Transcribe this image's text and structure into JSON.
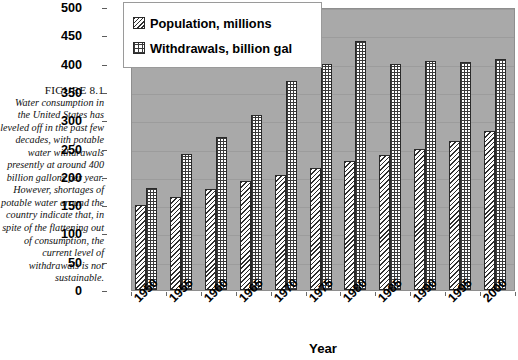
{
  "figure": {
    "caption_title": "FIGURE 8.1",
    "caption_body": "Water consumption in the United States has leveled off in the past few decades, with potable water withdrawals presently at around 400 billion gallons per year. However, shortages of potable water around the country indicate that, in spite of the flattening out of consumption, the current level of withdrawals is not sustainable."
  },
  "chart_data": {
    "type": "bar",
    "title": "",
    "xlabel": "Year",
    "ylabel": "",
    "ylim": [
      0,
      500
    ],
    "yticks": [
      0,
      50,
      100,
      150,
      200,
      250,
      300,
      350,
      400,
      450,
      500
    ],
    "grid": true,
    "legend_position": "top-left",
    "categories": [
      "1950",
      "1955",
      "1960",
      "1965",
      "1970",
      "1975",
      "1980",
      "1985",
      "1990",
      "1995",
      "2000"
    ],
    "series": [
      {
        "name": "Population, millions",
        "pattern": "diagonal-hatch",
        "values": [
          150,
          165,
          178,
          193,
          204,
          216,
          228,
          239,
          250,
          263,
          281
        ]
      },
      {
        "name": "Withdrawals, billion gal",
        "pattern": "crosshatch-grid",
        "values": [
          180,
          240,
          270,
          310,
          370,
          400,
          440,
          400,
          405,
          403,
          408
        ]
      }
    ]
  },
  "colors": {
    "plot_background": "#a9a9a9",
    "legend_background": "#ffffff",
    "bar_outline": "#2a2a2a",
    "gridline": "#9c9c9c",
    "text": "#000000"
  }
}
